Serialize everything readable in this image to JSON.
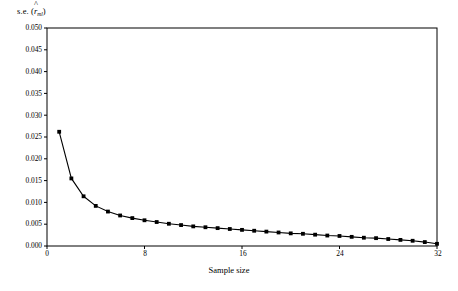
{
  "chart_data": {
    "type": "line",
    "title": "",
    "subtitle": "",
    "xlabel": "Sample size",
    "ylabel": "s.e. (r̂ml)",
    "ylabel_parts": {
      "prefix": "s.e. (",
      "symbol": "r",
      "accent": "^",
      "subscript": "ml",
      "suffix": ")"
    },
    "xlim": [
      0,
      32
    ],
    "ylim": [
      0,
      0.05
    ],
    "xticks": [
      0,
      8,
      16,
      24,
      32
    ],
    "xtick_labels": [
      "0",
      "8",
      "16",
      "24",
      "32"
    ],
    "yticks": [
      0.0,
      0.005,
      0.01,
      0.015,
      0.02,
      0.025,
      0.03,
      0.035,
      0.04,
      0.045,
      0.05
    ],
    "ytick_labels": [
      "0.000",
      "0.005",
      "0.010",
      "0.015",
      "0.020",
      "0.025",
      "0.030",
      "0.035",
      "0.040",
      "0.045",
      "0.050"
    ],
    "grid": false,
    "legend": null,
    "legend_position": "none",
    "series": [
      {
        "name": "s.e. of r-hat ml",
        "marker": "filled-square",
        "line_color": "#000000",
        "marker_color": "#000000",
        "x": [
          1,
          2,
          3,
          4,
          5,
          6,
          7,
          8,
          9,
          10,
          11,
          12,
          13,
          14,
          15,
          16,
          17,
          18,
          19,
          20,
          21,
          22,
          23,
          24,
          25,
          26,
          27,
          28,
          29,
          30,
          31,
          32
        ],
        "values": [
          0.0262,
          0.0155,
          0.0114,
          0.0092,
          0.0079,
          0.007,
          0.0064,
          0.0059,
          0.0055,
          0.0051,
          0.0048,
          0.0045,
          0.0043,
          0.0041,
          0.0039,
          0.0037,
          0.0035,
          0.0033,
          0.0031,
          0.0029,
          0.0028,
          0.0026,
          0.0024,
          0.0023,
          0.0021,
          0.0019,
          0.0018,
          0.0016,
          0.0014,
          0.0012,
          0.0009,
          0.0005
        ]
      }
    ]
  },
  "axes": {
    "frame_color": "#000000",
    "tick_color": "#000000",
    "background": "#ffffff"
  }
}
